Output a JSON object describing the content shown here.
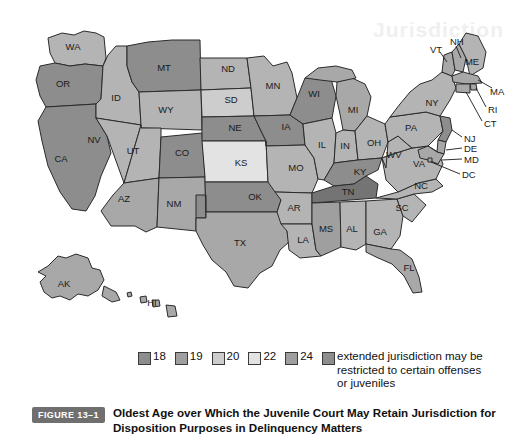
{
  "figure": {
    "badge": "FIGURE 13–1",
    "caption": "Oldest Age over Which the Juvenile Court May Retain Jurisdiction for Disposition Purposes in Delinquency Matters",
    "ghost_text": "Jurisdiction"
  },
  "legend": {
    "items": [
      {
        "label": "18",
        "color": "#8d8d8d"
      },
      {
        "label": "19",
        "color": "#9f9f9f"
      },
      {
        "label": "20",
        "color": "#cdcdcd"
      },
      {
        "label": "22",
        "color": "#e3e3e3"
      },
      {
        "label": "24",
        "color": "#9f9f9f"
      }
    ],
    "note": {
      "color": "#8d8d8d",
      "text": "extended jurisdiction may be restricted to certain offenses or juveniles"
    }
  },
  "palette": {
    "age18": "#8d8d8d",
    "age19": "#747474",
    "age20": "#b4b4b4",
    "age22": "#e3e3e3",
    "age24": "#a8a8a8",
    "outline": "#2b2b2b",
    "background": "#ffffff"
  },
  "map_data": {
    "type": "choropleth",
    "region": "United States",
    "value_label": "Oldest age of juvenile court jurisdiction",
    "states": [
      {
        "code": "WA",
        "value": 20,
        "fill": "#b4b4b4",
        "x": 73,
        "y": 47
      },
      {
        "code": "OR",
        "value": 18,
        "fill": "#8d8d8d",
        "x": 63,
        "y": 84
      },
      {
        "code": "CA",
        "value": 18,
        "fill": "#8d8d8d",
        "x": 61,
        "y": 159
      },
      {
        "code": "ID",
        "value": 20,
        "fill": "#b4b4b4",
        "x": 116,
        "y": 98
      },
      {
        "code": "NV",
        "value": 20,
        "fill": "#b4b4b4",
        "x": 94,
        "y": 140
      },
      {
        "code": "MT",
        "value": 18,
        "fill": "#8d8d8d",
        "x": 164,
        "y": 68
      },
      {
        "code": "WY",
        "value": 20,
        "fill": "#b4b4b4",
        "x": 166,
        "y": 110
      },
      {
        "code": "UT",
        "value": 20,
        "fill": "#b4b4b4",
        "x": 133,
        "y": 151
      },
      {
        "code": "CO",
        "value": 18,
        "fill": "#8d8d8d",
        "x": 182,
        "y": 153
      },
      {
        "code": "AZ",
        "value": 18,
        "fill": "#a8a8a8",
        "x": 124,
        "y": 199
      },
      {
        "code": "NM",
        "value": 18,
        "fill": "#a8a8a8",
        "x": 174,
        "y": 204
      },
      {
        "code": "ND",
        "value": 20,
        "fill": "#b4b4b4",
        "x": 228,
        "y": 69
      },
      {
        "code": "SD",
        "value": 20,
        "fill": "#cdcdcd",
        "x": 231,
        "y": 100
      },
      {
        "code": "NE",
        "value": 18,
        "fill": "#8d8d8d",
        "x": 235,
        "y": 128
      },
      {
        "code": "KS",
        "value": 22,
        "fill": "#e3e3e3",
        "x": 241,
        "y": 163
      },
      {
        "code": "OK",
        "value": 18,
        "fill": "#8d8d8d",
        "x": 255,
        "y": 197
      },
      {
        "code": "TX",
        "value": 18,
        "fill": "#a8a8a8",
        "x": 240,
        "y": 243
      },
      {
        "code": "MN",
        "value": 18,
        "fill": "#b4b4b4",
        "x": 273,
        "y": 86
      },
      {
        "code": "IA",
        "value": 18,
        "fill": "#8d8d8d",
        "x": 286,
        "y": 127
      },
      {
        "code": "MO",
        "value": 20,
        "fill": "#b4b4b4",
        "x": 296,
        "y": 168
      },
      {
        "code": "AR",
        "value": 20,
        "fill": "#b4b4b4",
        "x": 294,
        "y": 208
      },
      {
        "code": "LA",
        "value": 20,
        "fill": "#b4b4b4",
        "x": 303,
        "y": 240
      },
      {
        "code": "WI",
        "value": 18,
        "fill": "#8d8d8d",
        "x": 314,
        "y": 94
      },
      {
        "code": "IL",
        "value": 20,
        "fill": "#b4b4b4",
        "x": 322,
        "y": 145
      },
      {
        "code": "MS",
        "value": 19,
        "fill": "#9f9f9f",
        "x": 326,
        "y": 229
      },
      {
        "code": "MI",
        "value": 18,
        "fill": "#a8a8a8",
        "x": 353,
        "y": 110
      },
      {
        "code": "IN",
        "value": 20,
        "fill": "#b4b4b4",
        "x": 345,
        "y": 146
      },
      {
        "code": "KY",
        "value": 18,
        "fill": "#8d8d8d",
        "x": 360,
        "y": 172
      },
      {
        "code": "TN",
        "value": 18,
        "fill": "#747474",
        "x": 348,
        "y": 192
      },
      {
        "code": "AL",
        "value": 20,
        "fill": "#b4b4b4",
        "x": 352,
        "y": 229
      },
      {
        "code": "OH",
        "value": 20,
        "fill": "#b4b4b4",
        "x": 374,
        "y": 143
      },
      {
        "code": "GA",
        "value": 20,
        "fill": "#b4b4b4",
        "x": 380,
        "y": 232
      },
      {
        "code": "FL",
        "value": 18,
        "fill": "#a8a8a8",
        "x": 409,
        "y": 268
      },
      {
        "code": "SC",
        "value": 20,
        "fill": "#b4b4b4",
        "x": 402,
        "y": 208
      },
      {
        "code": "NC",
        "value": 18,
        "fill": "#b4b4b4",
        "x": 421,
        "y": 186
      },
      {
        "code": "VA",
        "value": 20,
        "fill": "#b4b4b4",
        "x": 419,
        "y": 164
      },
      {
        "code": "WV",
        "value": 20,
        "fill": "#b4b4b4",
        "x": 394,
        "y": 155
      },
      {
        "code": "PA",
        "value": 20,
        "fill": "#b4b4b4",
        "x": 411,
        "y": 128
      },
      {
        "code": "NY",
        "value": 18,
        "fill": "#b4b4b4",
        "x": 432,
        "y": 103
      },
      {
        "code": "VT",
        "value": 18,
        "fill": "#a8a8a8",
        "x": 436,
        "y": 59
      },
      {
        "code": "NH",
        "value": 18,
        "fill": "#a8a8a8",
        "x": 452,
        "y": 49
      },
      {
        "code": "ME",
        "value": 20,
        "fill": "#b4b4b4",
        "x": 472,
        "y": 62
      },
      {
        "code": "MA",
        "value": 18,
        "fill": "#a8a8a8",
        "x": 477,
        "y": 94
      },
      {
        "code": "RI",
        "value": 20,
        "fill": "#a8a8a8",
        "x": 479,
        "y": 113
      },
      {
        "code": "CT",
        "value": 20,
        "fill": "#a8a8a8",
        "x": 478,
        "y": 127
      },
      {
        "code": "NJ",
        "value": 18,
        "fill": "#8d8d8d",
        "x": 466,
        "y": 141
      },
      {
        "code": "DE",
        "value": 20,
        "fill": "#a8a8a8",
        "x": 466,
        "y": 152
      },
      {
        "code": "MD",
        "value": 20,
        "fill": "#a8a8a8",
        "x": 467,
        "y": 163
      },
      {
        "code": "DC",
        "value": 20,
        "fill": "#a8a8a8",
        "x": 464,
        "y": 177
      },
      {
        "code": "AK",
        "value": 18,
        "fill": "#a8a8a8",
        "x": 64,
        "y": 284
      },
      {
        "code": "HI",
        "value": 18,
        "fill": "#a8a8a8",
        "x": 152,
        "y": 303
      }
    ]
  }
}
